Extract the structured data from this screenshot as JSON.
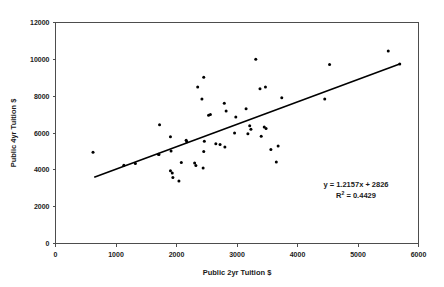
{
  "chart_data": {
    "type": "scatter",
    "title": "",
    "xlabel": "Public 2yr Tuition $",
    "ylabel": "Public 4yr Tuition $",
    "xlim": [
      0,
      6000
    ],
    "ylim": [
      0,
      12000
    ],
    "xticks": [
      0,
      1000,
      2000,
      3000,
      4000,
      5000,
      6000
    ],
    "yticks": [
      0,
      2000,
      4000,
      6000,
      8000,
      10000,
      12000
    ],
    "grid": false,
    "legend": null,
    "point_color": "#000000",
    "trendline_color": "#000000",
    "annotations": {
      "equation": "y = 1.2157x + 2826",
      "r_squared_label": "R",
      "r_squared_exponent": "2",
      "r_squared_value": " = 0.4429"
    },
    "trendline": {
      "slope": 1.2157,
      "intercept": 2826,
      "x_start": 640,
      "x_end": 5700,
      "y_start": 3604,
      "y_end": 9756
    },
    "points": [
      [
        620,
        4950
      ],
      [
        1130,
        4250
      ],
      [
        1320,
        4350
      ],
      [
        1700,
        4850
      ],
      [
        1710,
        4830
      ],
      [
        1720,
        6450
      ],
      [
        1900,
        3950
      ],
      [
        1900,
        5800
      ],
      [
        1910,
        5020
      ],
      [
        1930,
        3830
      ],
      [
        1940,
        3580
      ],
      [
        2040,
        3400
      ],
      [
        2080,
        4400
      ],
      [
        2160,
        5600
      ],
      [
        2170,
        5520
      ],
      [
        2300,
        4370
      ],
      [
        2320,
        4240
      ],
      [
        2350,
        8500
      ],
      [
        2420,
        7850
      ],
      [
        2440,
        4100
      ],
      [
        2450,
        9030
      ],
      [
        2450,
        5000
      ],
      [
        2460,
        5550
      ],
      [
        2530,
        6960
      ],
      [
        2560,
        7010
      ],
      [
        2650,
        5420
      ],
      [
        2720,
        5380
      ],
      [
        2790,
        7620
      ],
      [
        2800,
        5240
      ],
      [
        2820,
        7200
      ],
      [
        2960,
        6000
      ],
      [
        2980,
        6870
      ],
      [
        3150,
        7320
      ],
      [
        3180,
        5960
      ],
      [
        3210,
        6400
      ],
      [
        3230,
        6200
      ],
      [
        3310,
        10000
      ],
      [
        3380,
        8400
      ],
      [
        3400,
        5820
      ],
      [
        3450,
        6320
      ],
      [
        3470,
        8500
      ],
      [
        3480,
        6240
      ],
      [
        3560,
        5100
      ],
      [
        3650,
        4420
      ],
      [
        3680,
        5300
      ],
      [
        3740,
        7920
      ],
      [
        4450,
        7850
      ],
      [
        4530,
        9720
      ],
      [
        5500,
        10450
      ],
      [
        5690,
        9750
      ]
    ]
  }
}
